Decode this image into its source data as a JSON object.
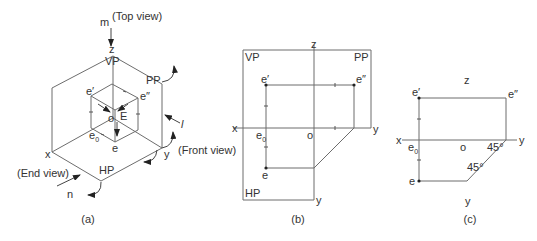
{
  "figures": {
    "a": {
      "caption": "(a)",
      "labels": {
        "m": "m",
        "top_view": "(Top view)",
        "z": "z",
        "vp": "VP",
        "pp": "PP",
        "e_prime": "e′",
        "e_dprime": "e″",
        "E": "E",
        "o": "o",
        "e0": "e",
        "e0_sub": "0",
        "e": "e",
        "l": "l",
        "front_view": "(Front view)",
        "x": "x",
        "y": "y",
        "end_view": "(End view)",
        "hp": "HP",
        "n": "n"
      }
    },
    "b": {
      "caption": "(b)",
      "labels": {
        "z": "z",
        "vp": "VP",
        "pp": "PP",
        "e_prime": "e′",
        "e_dprime": "e″",
        "x": "x",
        "e0": "e",
        "e0_sub": "0",
        "o": "o",
        "y_right": "y",
        "e": "e",
        "hp": "HP",
        "y_bottom": "y"
      }
    },
    "c": {
      "caption": "(c)",
      "labels": {
        "z": "z",
        "e_prime": "e′",
        "e_dprime": "e″",
        "x": "x",
        "e0": "e",
        "e0_sub": "0",
        "o": "o",
        "angle1": "45°",
        "y_right": "y",
        "angle2": "45°",
        "e": "e",
        "y_bottom": "y"
      }
    }
  },
  "colors": {
    "line": "#6d6d6d",
    "text": "#333333",
    "background": "#ffffff"
  }
}
